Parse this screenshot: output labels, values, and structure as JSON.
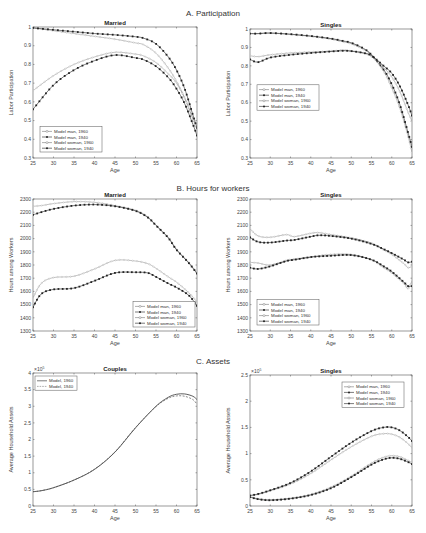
{
  "sections": [
    {
      "label": "A. Participation",
      "x": 213,
      "y": 16
    },
    {
      "label": "B. Hours for workers",
      "x": 213,
      "y": 191
    },
    {
      "label": "C. Assets",
      "x": 213,
      "y": 364
    }
  ],
  "legend_labels": {
    "four": [
      "Model man, 1960",
      "Model man, 1940",
      "Model woman, 1960",
      "Model woman, 1940"
    ],
    "two": [
      "Model, 1960",
      "Model, 1940"
    ]
  },
  "chart_data": [
    {
      "id": "A_married",
      "type": "line",
      "section": "A. Participation",
      "title": "Married",
      "xlabel": "Age",
      "ylabel": "Labor Participation",
      "xlim": [
        25,
        65
      ],
      "ylim": [
        0.3,
        1.0
      ],
      "xticks": [
        25,
        30,
        35,
        40,
        45,
        50,
        55,
        60,
        65
      ],
      "yticks": [
        0.3,
        0.4,
        0.5,
        0.6,
        0.7,
        0.8,
        0.9,
        1
      ],
      "legend_position": "lower left",
      "box": {
        "x0": 33,
        "x1": 197,
        "y0": 27,
        "y1": 158
      },
      "x": [
        25,
        30,
        35,
        40,
        45,
        50,
        52,
        55,
        58,
        60,
        62,
        64,
        65
      ],
      "series": [
        {
          "name": "Model man, 1960",
          "style": "open-circle-thin",
          "values": [
            0.995,
            0.98,
            0.965,
            0.95,
            0.935,
            0.915,
            0.905,
            0.86,
            0.78,
            0.71,
            0.62,
            0.51,
            0.46
          ]
        },
        {
          "name": "Model man, 1940",
          "style": "filled-dot",
          "values": [
            0.995,
            0.985,
            0.975,
            0.965,
            0.958,
            0.948,
            0.94,
            0.91,
            0.84,
            0.77,
            0.67,
            0.53,
            0.46
          ]
        },
        {
          "name": "Model woman, 1960",
          "style": "open-circle-thin",
          "values": [
            0.66,
            0.74,
            0.8,
            0.84,
            0.865,
            0.855,
            0.845,
            0.81,
            0.75,
            0.7,
            0.62,
            0.51,
            0.45
          ]
        },
        {
          "name": "Model woman, 1940",
          "style": "filled-dot",
          "values": [
            0.56,
            0.69,
            0.77,
            0.82,
            0.85,
            0.835,
            0.825,
            0.79,
            0.73,
            0.67,
            0.59,
            0.48,
            0.42
          ]
        }
      ]
    },
    {
      "id": "A_singles",
      "type": "line",
      "section": "A. Participation",
      "title": "Singles",
      "xlabel": "Age",
      "ylabel": "Labor Participation",
      "xlim": [
        25,
        65
      ],
      "ylim": [
        0.3,
        1.0
      ],
      "xticks": [
        25,
        30,
        35,
        40,
        45,
        50,
        55,
        60,
        65
      ],
      "yticks": [
        0.3,
        0.4,
        0.5,
        0.6,
        0.7,
        0.8,
        0.9,
        1
      ],
      "legend_position": "center left",
      "box": {
        "x0": 250,
        "x1": 412,
        "y0": 29,
        "y1": 158
      },
      "x": [
        25,
        27,
        30,
        35,
        40,
        45,
        48,
        50,
        53,
        55,
        58,
        60,
        62,
        64,
        65
      ],
      "series": [
        {
          "name": "Model man, 1960",
          "style": "open-circle-thin",
          "values": [
            0.975,
            0.975,
            0.978,
            0.97,
            0.96,
            0.945,
            0.93,
            0.92,
            0.89,
            0.86,
            0.77,
            0.68,
            0.57,
            0.42,
            0.33
          ]
        },
        {
          "name": "Model man, 1940",
          "style": "filled-dot",
          "values": [
            0.975,
            0.975,
            0.978,
            0.972,
            0.962,
            0.948,
            0.935,
            0.925,
            0.895,
            0.86,
            0.78,
            0.7,
            0.59,
            0.44,
            0.36
          ]
        },
        {
          "name": "Model woman, 1960",
          "style": "open-circle-thin",
          "values": [
            0.855,
            0.85,
            0.86,
            0.87,
            0.875,
            0.88,
            0.885,
            0.88,
            0.87,
            0.85,
            0.79,
            0.74,
            0.66,
            0.55,
            0.5
          ]
        },
        {
          "name": "Model woman, 1940",
          "style": "filled-dot",
          "values": [
            0.835,
            0.82,
            0.845,
            0.86,
            0.87,
            0.878,
            0.882,
            0.88,
            0.87,
            0.855,
            0.8,
            0.76,
            0.69,
            0.59,
            0.53
          ]
        }
      ]
    },
    {
      "id": "B_married",
      "type": "line",
      "section": "B. Hours for workers",
      "title": "Married",
      "xlabel": "Age",
      "ylabel": "Hours among Workers",
      "xlim": [
        25,
        65
      ],
      "ylim": [
        1300,
        2300
      ],
      "xticks": [
        25,
        30,
        35,
        40,
        45,
        50,
        55,
        60,
        65
      ],
      "yticks": [
        1300,
        1400,
        1500,
        1600,
        1700,
        1800,
        1900,
        2000,
        2100,
        2200,
        2300
      ],
      "legend_position": "lower right",
      "box": {
        "x0": 33,
        "x1": 197,
        "y0": 199,
        "y1": 331
      },
      "x": [
        25,
        27,
        30,
        35,
        40,
        45,
        50,
        53,
        55,
        58,
        60,
        63,
        65
      ],
      "series": [
        {
          "name": "Model man, 1960",
          "style": "open-circle-thin",
          "values": [
            2245,
            2250,
            2265,
            2280,
            2275,
            2250,
            2215,
            2165,
            2100,
            2010,
            1920,
            1820,
            1740
          ]
        },
        {
          "name": "Model man, 1940",
          "style": "filled-dot",
          "values": [
            2180,
            2200,
            2225,
            2250,
            2258,
            2245,
            2210,
            2160,
            2100,
            2005,
            1915,
            1815,
            1735
          ]
        },
        {
          "name": "Model woman, 1960",
          "style": "open-circle-thin",
          "values": [
            1550,
            1660,
            1705,
            1715,
            1770,
            1835,
            1830,
            1810,
            1775,
            1710,
            1670,
            1590,
            1520
          ]
        },
        {
          "name": "Model woman, 1940",
          "style": "filled-dot",
          "values": [
            1480,
            1580,
            1615,
            1625,
            1680,
            1740,
            1745,
            1740,
            1710,
            1660,
            1630,
            1570,
            1490
          ]
        }
      ]
    },
    {
      "id": "B_singles",
      "type": "line",
      "section": "B. Hours for workers",
      "title": "Singles",
      "xlabel": "Age",
      "ylabel": "Hours among Workers",
      "xlim": [
        25,
        65
      ],
      "ylim": [
        1300,
        2300
      ],
      "xticks": [
        25,
        30,
        35,
        40,
        45,
        50,
        55,
        60,
        65
      ],
      "yticks": [
        1300,
        1400,
        1500,
        1600,
        1700,
        1800,
        1900,
        2000,
        2100,
        2200,
        2300
      ],
      "legend_position": "lower left",
      "box": {
        "x0": 250,
        "x1": 412,
        "y0": 199,
        "y1": 331
      },
      "x": [
        25,
        27,
        30,
        34,
        36,
        40,
        42,
        45,
        50,
        55,
        58,
        60,
        63,
        64,
        65
      ],
      "series": [
        {
          "name": "Model man, 1960",
          "style": "open-circle-thin",
          "values": [
            2075,
            2020,
            2010,
            2030,
            2015,
            2040,
            2045,
            2030,
            2005,
            1965,
            1915,
            1880,
            1810,
            1780,
            1790
          ]
        },
        {
          "name": "Model man, 1940",
          "style": "filled-dot",
          "values": [
            2010,
            1975,
            1970,
            1985,
            1990,
            2015,
            2025,
            2020,
            2000,
            1960,
            1920,
            1890,
            1840,
            1820,
            1825
          ]
        },
        {
          "name": "Model woman, 1960",
          "style": "open-circle-thin",
          "values": [
            1820,
            1815,
            1800,
            1835,
            1845,
            1860,
            1870,
            1880,
            1880,
            1840,
            1780,
            1740,
            1660,
            1620,
            1680
          ]
        },
        {
          "name": "Model woman, 1940",
          "style": "filled-dot",
          "values": [
            1780,
            1770,
            1790,
            1830,
            1840,
            1860,
            1865,
            1870,
            1875,
            1840,
            1790,
            1750,
            1670,
            1640,
            1640
          ]
        }
      ]
    },
    {
      "id": "C_couples",
      "type": "line",
      "section": "C. Assets",
      "title": "Couples",
      "xlabel": "Age",
      "ylabel": "Average Household Assets",
      "y_multiplier": "x10^5",
      "xlim": [
        25,
        65
      ],
      "ylim": [
        0,
        4
      ],
      "xticks": [
        25,
        30,
        35,
        40,
        45,
        50,
        55,
        60,
        65
      ],
      "yticks": [
        0,
        0.5,
        1,
        1.5,
        2,
        2.5,
        3,
        3.5,
        4
      ],
      "legend_position": "upper left",
      "box": {
        "x0": 33,
        "x1": 197,
        "y0": 373,
        "y1": 506
      },
      "x": [
        25,
        27,
        30,
        35,
        40,
        45,
        50,
        55,
        58,
        60,
        62,
        64,
        65
      ],
      "series": [
        {
          "name": "Model, 1960",
          "style": "solid",
          "values": [
            0.43,
            0.46,
            0.55,
            0.78,
            1.1,
            1.62,
            2.35,
            3.0,
            3.27,
            3.36,
            3.37,
            3.3,
            3.2
          ]
        },
        {
          "name": "Model, 1940",
          "style": "dashed",
          "values": [
            0.43,
            0.46,
            0.55,
            0.78,
            1.11,
            1.63,
            2.36,
            2.99,
            3.24,
            3.31,
            3.3,
            3.2,
            3.06
          ]
        }
      ]
    },
    {
      "id": "C_singles",
      "type": "line",
      "section": "C. Assets",
      "title": "Singles",
      "xlabel": "Age",
      "ylabel": "Average Household Assets",
      "y_multiplier": "x10^5",
      "xlim": [
        25,
        65
      ],
      "ylim": [
        0,
        2.5
      ],
      "xticks": [
        25,
        30,
        35,
        40,
        45,
        50,
        55,
        60,
        65
      ],
      "yticks": [
        0,
        0.5,
        1,
        1.5,
        2,
        2.5
      ],
      "legend_position": "upper right",
      "box": {
        "x0": 250,
        "x1": 412,
        "y0": 375,
        "y1": 506
      },
      "x": [
        25,
        27,
        30,
        35,
        40,
        45,
        50,
        55,
        58,
        60,
        62,
        64,
        65
      ],
      "series": [
        {
          "name": "Model man, 1960",
          "style": "open-circle-thin",
          "values": [
            0.18,
            0.14,
            0.12,
            0.15,
            0.22,
            0.36,
            0.57,
            0.82,
            0.93,
            0.96,
            0.94,
            0.87,
            0.83
          ]
        },
        {
          "name": "Model man, 1940",
          "style": "filled-dot",
          "values": [
            0.17,
            0.13,
            0.11,
            0.14,
            0.21,
            0.34,
            0.55,
            0.79,
            0.89,
            0.92,
            0.9,
            0.84,
            0.8
          ]
        },
        {
          "name": "Model woman, 1960",
          "style": "open-circle-thin",
          "values": [
            0.2,
            0.22,
            0.29,
            0.42,
            0.62,
            0.88,
            1.13,
            1.33,
            1.38,
            1.37,
            1.31,
            1.19,
            1.11
          ]
        },
        {
          "name": "Model woman, 1940",
          "style": "filled-dot",
          "values": [
            0.2,
            0.23,
            0.3,
            0.44,
            0.66,
            0.94,
            1.21,
            1.43,
            1.5,
            1.5,
            1.44,
            1.32,
            1.24
          ]
        }
      ]
    }
  ]
}
